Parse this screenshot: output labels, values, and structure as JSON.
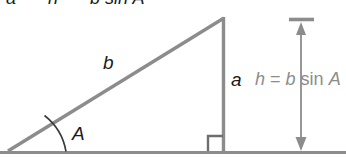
{
  "figure": {
    "colors": {
      "stroke_gray": "#8c8c8c",
      "stroke_dark": "#6e6e6e",
      "label_black": "#1a1a1a",
      "label_gray": "#8c8c8c",
      "background": "#ffffff"
    },
    "cutoff_top_text": {
      "part1": "a",
      "part2": "h",
      "part3": "b sin A"
    },
    "labels": {
      "hypotenuse": "b",
      "vertical_leg": "a",
      "angle": "A",
      "equation_lhs": "h",
      "equation_eq": "=",
      "equation_rhs_var": "b",
      "equation_rhs_fn": "sin",
      "equation_rhs_angle": "A"
    },
    "geometry": {
      "baseline_y": 152,
      "left_vertex_x": 8,
      "apex_x": 224,
      "apex_y": 17,
      "arrow_x": 301,
      "arrow_top_y": 23,
      "arrow_bottom_y": 151,
      "tick_x1": 289,
      "tick_x2": 314,
      "right_angle_size": 15
    }
  }
}
